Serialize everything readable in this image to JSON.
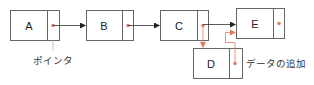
{
  "diagram": {
    "title": "",
    "nodes": [
      {
        "id": "A",
        "label": "A"
      },
      {
        "id": "B",
        "label": "B"
      },
      {
        "id": "C",
        "label": "C"
      },
      {
        "id": "E",
        "label": "E"
      },
      {
        "id": "D",
        "label": "D"
      }
    ],
    "edges": [
      {
        "from": "A",
        "to": "B",
        "style": "black"
      },
      {
        "from": "B",
        "to": "C",
        "style": "black"
      },
      {
        "from": "C",
        "to": "E",
        "style": "black"
      },
      {
        "from": "C",
        "to": "D",
        "style": "red"
      },
      {
        "from": "D",
        "to": "E",
        "style": "red"
      }
    ],
    "annotations": {
      "pointer_label": "ポインタ",
      "add_data_label": "データの追加"
    },
    "colors": {
      "box_stroke": "#555555",
      "arrow": "#222222",
      "new_link": "#e07a60",
      "pointer_dot": "#d9826a"
    }
  }
}
